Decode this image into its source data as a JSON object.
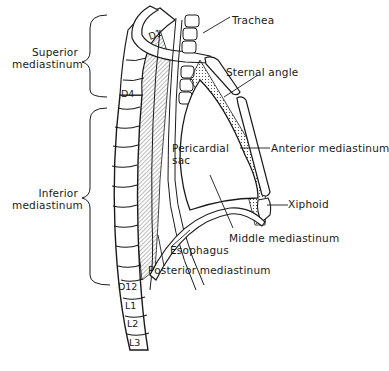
{
  "figure": {
    "type": "anatomical-diagram",
    "colors": {
      "ink": "#1a1a1a",
      "background": "#ffffff",
      "hatch": "#555555"
    }
  },
  "region_labels": {
    "superior": [
      "Superior",
      "mediastinum"
    ],
    "inferior": [
      "Inferior",
      "mediastinum"
    ]
  },
  "structure_labels": {
    "trachea": "Trachea",
    "sternal_angle": "Sternal angle",
    "pericardial_sac": [
      "Pericardial",
      "sac"
    ],
    "anterior_mediastinum": "Anterior mediastinum",
    "xiphoid": "Xiphoid",
    "middle_mediastinum": "Middle mediastinum",
    "esophagus": "Esophagus",
    "posterior_mediastinum": "Posterior mediastinum"
  },
  "vertebra_labels": {
    "d1": "D1",
    "d4": "D4",
    "d12": "D12",
    "l1": "L1",
    "l2": "L2",
    "l3": "L3"
  }
}
